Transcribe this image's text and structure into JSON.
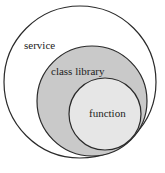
{
  "diagram": {
    "type": "nested-circles",
    "colors": {
      "background": "#ffffff",
      "stroke": "#2a2a2a",
      "outer_fill": "#ffffff",
      "middle_fill": "#c9c9c9",
      "inner_fill": "#e6e6e6"
    },
    "circles": [
      {
        "label": "service",
        "cx": 80,
        "cy": 82,
        "r": 76
      },
      {
        "label": "class library",
        "cx": 92,
        "cy": 101,
        "r": 55
      },
      {
        "label": "function",
        "cx": 105,
        "cy": 114,
        "r": 36
      }
    ]
  }
}
